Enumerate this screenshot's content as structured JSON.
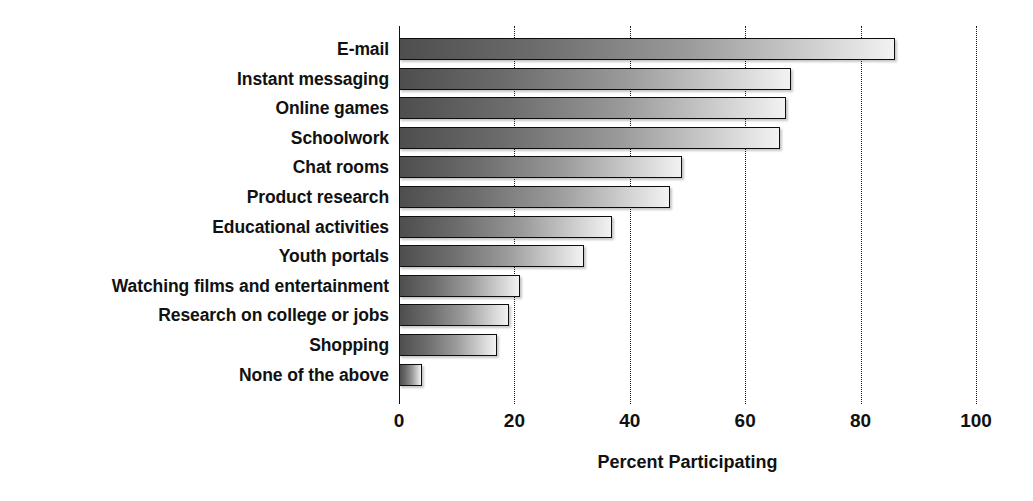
{
  "chart_data": {
    "type": "bar",
    "orientation": "horizontal",
    "title": "",
    "xlabel": "Percent Participating",
    "ylabel": "",
    "xlim": [
      0,
      100
    ],
    "xticks": [
      0,
      20,
      40,
      60,
      80,
      100
    ],
    "xtick_labels": [
      "0",
      "20",
      "40",
      "60",
      "80",
      "100"
    ],
    "grid": "vertical dotted gridlines at each x tick",
    "legend": "none",
    "bar_style": "horizontal gradient dark-gray to white, black outline, drop shadow",
    "categories": [
      "E-mail",
      "Instant messaging",
      "Online games",
      "Schoolwork",
      "Chat rooms",
      "Product research",
      "Educational activities",
      "Youth portals",
      "Watching films and entertainment",
      "Research on college or jobs",
      "Shopping",
      "None of the above"
    ],
    "values": [
      86,
      68,
      67,
      66,
      49,
      47,
      37,
      32,
      21,
      19,
      17,
      4
    ]
  },
  "axis": {
    "x_title": "Percent Participating"
  }
}
